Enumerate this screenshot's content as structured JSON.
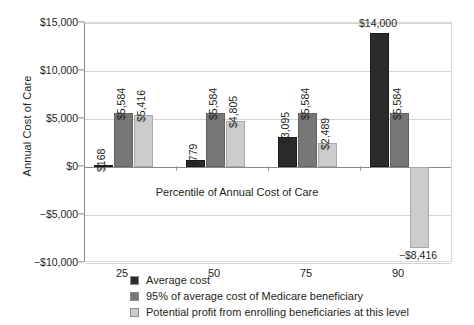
{
  "chart_data": {
    "type": "bar",
    "title": "",
    "xlabel": "Percentile of Annual Cost of Care",
    "ylabel": "Annual Cost of Care",
    "categories": [
      "25",
      "50",
      "75",
      "90"
    ],
    "ylim": [
      -10000,
      15000
    ],
    "ytick_values": [
      15000,
      10000,
      5000,
      0,
      -5000,
      -10000
    ],
    "ytick_labels": [
      "$15,000",
      "$10,000",
      "$5,000",
      "$0",
      "−$5,000",
      "−$10,000"
    ],
    "grid": true,
    "legend_position": "bottom",
    "series": [
      {
        "name": "Average cost",
        "color": "#2b2b2b",
        "values": [
          168,
          779,
          3095,
          14000
        ],
        "labels": [
          "$168",
          "$779",
          "$3,095",
          "$14,000"
        ]
      },
      {
        "name": "95% of average cost of Medicare beneficiary",
        "color": "#777777",
        "values": [
          5584,
          5584,
          5584,
          5584
        ],
        "labels": [
          "$5,584",
          "$5,584",
          "$5,584",
          "$5,584"
        ]
      },
      {
        "name": "Potential profit from enrolling beneficiaries at this level",
        "color": "#cccccc",
        "values": [
          5416,
          4805,
          2489,
          -8416
        ],
        "labels": [
          "$5,416",
          "$4,805",
          "$2,489",
          "−$8,416"
        ]
      }
    ]
  }
}
